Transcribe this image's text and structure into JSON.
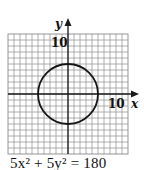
{
  "chart_data": {
    "type": "line",
    "title": "",
    "equation": "5x² + 5y² = 180",
    "curve": {
      "kind": "circle",
      "center": [
        0,
        0
      ],
      "radius": 6
    },
    "xlabel": "x",
    "ylabel": "y",
    "tick_labels": {
      "x": [
        "10"
      ],
      "y": [
        "10"
      ]
    },
    "xlim": [
      -10,
      10
    ],
    "ylim": [
      -10,
      10
    ],
    "grid": true,
    "legend": null
  },
  "labels": {
    "x_axis": "x",
    "y_axis": "y",
    "x_tick": "10",
    "y_tick": "10",
    "caption": "5x² + 5y² = 180"
  },
  "colors": {
    "grid": "#9a9a9a",
    "axis": "#1a1a1a",
    "curve": "#151515",
    "background": "#ffffff"
  }
}
